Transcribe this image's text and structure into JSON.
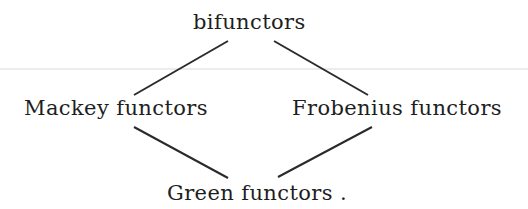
{
  "diagram": {
    "type": "hasse-diagram",
    "nodes": {
      "top": "bifunctors",
      "left": "Mackey functors",
      "right": "Frobenius functors",
      "bottom": "Green functors ."
    },
    "edges": [
      {
        "from": "top",
        "to": "left"
      },
      {
        "from": "top",
        "to": "right"
      },
      {
        "from": "left",
        "to": "bottom"
      },
      {
        "from": "right",
        "to": "bottom"
      }
    ],
    "colors": {
      "text": "#1e1e1e",
      "edge": "#2a2a2a",
      "background": "#ffffff",
      "scan_rule": "#ececec"
    }
  }
}
